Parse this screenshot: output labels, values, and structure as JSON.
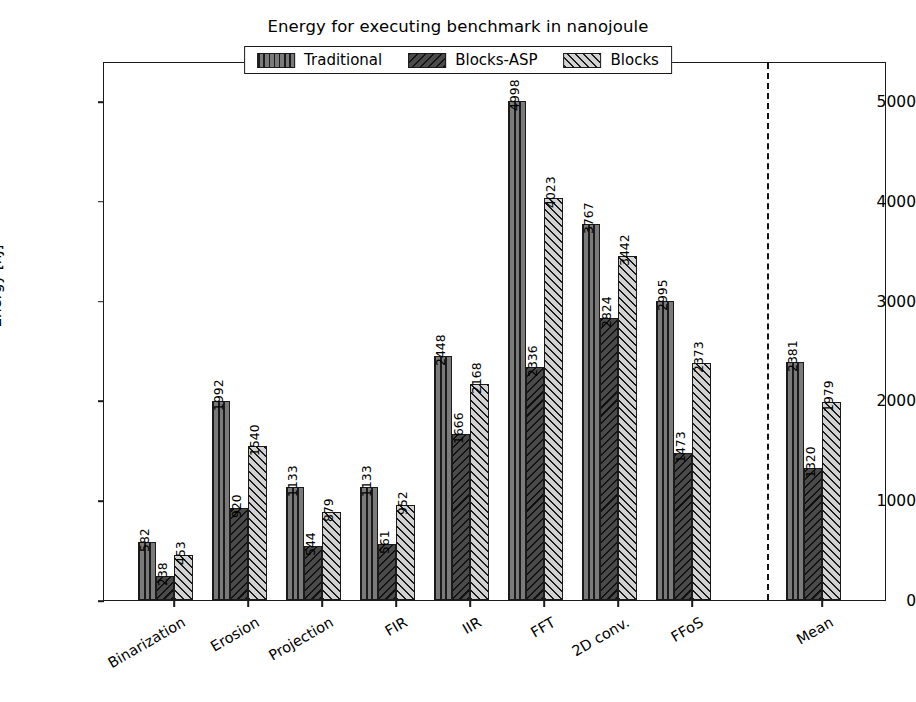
{
  "chart_data": {
    "type": "bar",
    "title": "Energy for executing benchmark in nanojoule",
    "xlabel": "",
    "ylabel": "Energy [nJ]",
    "ylim": [
      0,
      5400
    ],
    "yticks": [
      0,
      1000,
      2000,
      3000,
      4000,
      5000
    ],
    "ytick_labels": [
      "0",
      "1000",
      "2000",
      "3000",
      "4000",
      "5000"
    ],
    "grid": false,
    "legend_position": "upper center",
    "categories": [
      "Binarization",
      "Erosion",
      "Projection",
      "FIR",
      "IIR",
      "FFT",
      "2D conv.",
      "FFoS",
      "Mean"
    ],
    "series": [
      {
        "name": "Traditional",
        "pattern": "vertical-lines",
        "color": "#7a7a7a",
        "values": [
          582,
          1992,
          1133,
          1133,
          2448,
          4998,
          3767,
          2995,
          2381
        ]
      },
      {
        "name": "Blocks-ASP",
        "pattern": "backward-diagonal",
        "color": "#4a4a4a",
        "values": [
          238,
          920,
          544,
          561,
          1666,
          2336,
          2824,
          1473,
          1320
        ]
      },
      {
        "name": "Blocks",
        "pattern": "forward-diagonal",
        "color": "#d2d2d2",
        "values": [
          453,
          1540,
          879,
          952,
          2168,
          4023,
          3442,
          2373,
          1979
        ]
      }
    ],
    "annotations": [
      {
        "type": "vertical-dashed-line",
        "position_after_category": "FFoS",
        "description": "dashed separator before Mean group"
      }
    ]
  }
}
